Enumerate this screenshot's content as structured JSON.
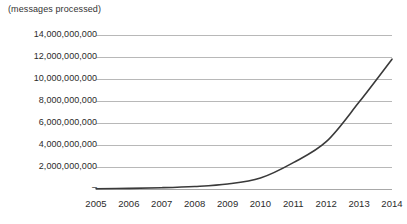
{
  "chart_data": {
    "type": "line",
    "title": "",
    "subtitle": "",
    "axis_note": "(messages processed)",
    "xlabel": "",
    "ylabel": "",
    "grid": true,
    "grid_axis": "y",
    "legend": "none",
    "categories": [
      "2005",
      "2006",
      "2007",
      "2008",
      "2009",
      "2010",
      "2011",
      "2012",
      "2013",
      "2014"
    ],
    "x": [
      2005,
      2006,
      2007,
      2008,
      2009,
      2010,
      2011,
      2012,
      2013,
      2014
    ],
    "series": [
      {
        "name": "messages processed",
        "color": "#3a3a3a",
        "values": [
          20000000,
          60000000,
          120000000,
          230000000,
          450000000,
          1000000000,
          2400000000,
          4300000000,
          7900000000,
          11800000000
        ]
      }
    ],
    "ylim": [
      0,
      14000000000
    ],
    "ytick_values": [
      2000000000,
      4000000000,
      6000000000,
      8000000000,
      10000000000,
      12000000000,
      14000000000
    ],
    "ytick_labels": [
      "2,000,000,000",
      "4,000,000,000",
      "6,000,000,000",
      "8,000,000,000",
      "10,000,000,000",
      "12,000,000,000",
      "14,000,000,000"
    ],
    "ytick_zero_label": "–",
    "xlim": [
      2005,
      2014
    ],
    "colors": {
      "line": "#3a3a3a",
      "grid": "#b8b8b8",
      "axis": "#a8a8a8",
      "text": "#2b2b2b",
      "background": "#ffffff"
    }
  }
}
